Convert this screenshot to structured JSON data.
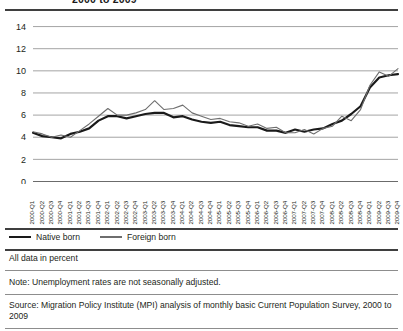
{
  "title": "2000 to 2009",
  "legend": {
    "native_label": "Native born",
    "foreign_label": "Foreign born",
    "native_color": "#1a1a1a",
    "foreign_color": "#6e6e6e"
  },
  "footer": {
    "all_data": "All data in percent",
    "note": "Note: Unemployment rates are not seasonally adjusted.",
    "source": "Source: Migration Policy Institute (MPI) analysis of monthly basic Current Population Survey, 2000 to 2009"
  },
  "chart_data": {
    "type": "line",
    "title": "2000 to 2009",
    "xlabel": "",
    "ylabel": "",
    "ylim": [
      0,
      15
    ],
    "yticks": [
      0,
      2,
      4,
      6,
      8,
      10,
      12,
      14
    ],
    "grid": true,
    "legend_position": "below",
    "categories": [
      "2000-Q1",
      "2000-Q2",
      "2000-Q3",
      "2000-Q4",
      "2001-Q1",
      "2001-Q2",
      "2001-Q3",
      "2001-Q4",
      "2002-Q1",
      "2002-Q2",
      "2002-Q3",
      "2002-Q4",
      "2003-Q1",
      "2003-Q2",
      "2003-Q3",
      "2003-Q4",
      "2004-Q1",
      "2004-Q2",
      "2004-Q3",
      "2004-Q4",
      "2005-Q1",
      "2005-Q2",
      "2005-Q3",
      "2005-Q4",
      "2006-Q1",
      "2006-Q2",
      "2006-Q3",
      "2006-Q4",
      "2007-Q1",
      "2007-Q2",
      "2007-Q3",
      "2007-Q4",
      "2008-Q1",
      "2008-Q2",
      "2008-Q3",
      "2008-Q4",
      "2009-Q1",
      "2009-Q2",
      "2009-Q3",
      "2009-Q4"
    ],
    "series": [
      {
        "name": "Native born",
        "color": "#1a1a1a",
        "width": 2.2,
        "values": [
          4.4,
          4.1,
          4.0,
          3.9,
          4.3,
          4.5,
          4.8,
          5.5,
          5.9,
          5.9,
          5.7,
          5.9,
          6.1,
          6.2,
          6.2,
          5.8,
          5.9,
          5.6,
          5.4,
          5.3,
          5.4,
          5.1,
          5.0,
          4.9,
          4.9,
          4.6,
          4.6,
          4.4,
          4.7,
          4.5,
          4.7,
          4.8,
          5.2,
          5.5,
          6.1,
          6.8,
          8.5,
          9.4,
          9.6,
          9.7
        ]
      },
      {
        "name": "Foreign born",
        "color": "#6e6e6e",
        "width": 1.1,
        "values": [
          4.5,
          4.3,
          4.0,
          4.2,
          4.0,
          4.6,
          5.2,
          5.9,
          6.6,
          6.0,
          6.0,
          6.2,
          6.5,
          7.3,
          6.5,
          6.6,
          6.9,
          6.2,
          5.9,
          5.6,
          5.7,
          5.4,
          5.3,
          5.0,
          5.2,
          4.8,
          4.9,
          4.4,
          4.4,
          4.7,
          4.3,
          4.8,
          5.0,
          5.9,
          5.5,
          6.5,
          8.7,
          9.9,
          9.5,
          10.2
        ]
      }
    ]
  }
}
